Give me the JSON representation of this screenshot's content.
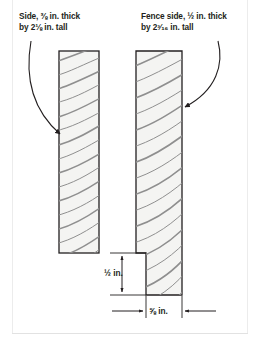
{
  "figure": {
    "background": "#ffffff",
    "stroke_color": "#231f20",
    "grain_color": "#8c8c8c",
    "board_fill": "#f4f4f2"
  },
  "labels": {
    "left": {
      "line1": "Side, ⅜ in. thick",
      "line2": "by 2⅛ in. tall"
    },
    "right": {
      "line1": "Fence side, ½ in. thick",
      "line2": "by 2³⁄₁₆ in. tall"
    }
  },
  "dimensions": {
    "vertical": {
      "value": "½ in.",
      "orientation": "vertical",
      "arrows": "both-inward"
    },
    "horizontal": {
      "value": "⅝ in.",
      "orientation": "horizontal",
      "arrows": "both-outward"
    }
  },
  "parts": [
    {
      "name": "side-board",
      "label_ref": "left",
      "thickness": "⅜ in.",
      "height": "2⅛ in.",
      "shape": "rectangle"
    },
    {
      "name": "fence-side-board",
      "label_ref": "right",
      "thickness": "½ in.",
      "height": "2³⁄₁₆ in.",
      "shape": "stepped-rectangle"
    }
  ],
  "callouts": [
    {
      "name": "left-callout-arrow",
      "from": "left-label",
      "to": "side-board"
    },
    {
      "name": "right-callout-arrow",
      "from": "right-label",
      "to": "fence-side-board"
    }
  ]
}
